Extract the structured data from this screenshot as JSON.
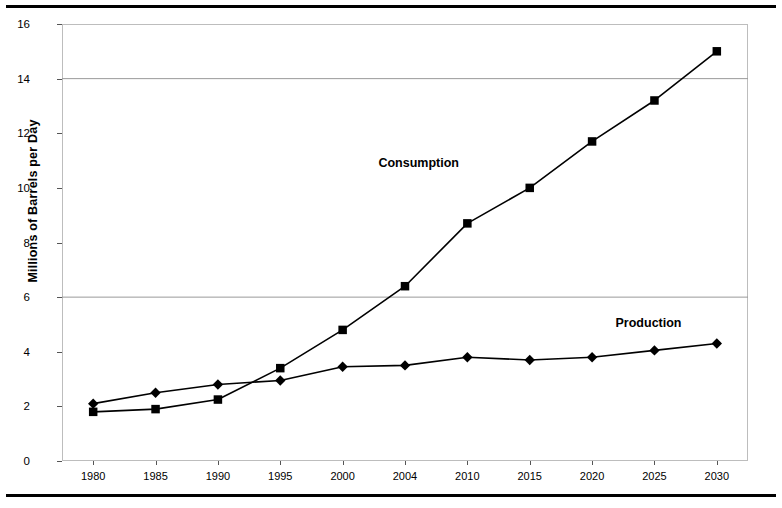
{
  "chart_data": {
    "type": "line",
    "title": "",
    "xlabel": "",
    "ylabel": "Millions of Barrels per Day",
    "categories": [
      "1980",
      "1985",
      "1990",
      "1995",
      "2000",
      "2004",
      "2010",
      "2015",
      "2020",
      "2025",
      "2030"
    ],
    "ylim": [
      0,
      16
    ],
    "ytick_values": [
      0,
      2,
      4,
      6,
      8,
      10,
      12,
      14,
      16
    ],
    "ytick_labels": [
      "0",
      "2",
      "4",
      "6",
      "8",
      "10",
      "12",
      "14",
      "16"
    ],
    "grid": "horizontal gridlines at 6 and 14",
    "gridlines": [
      6,
      14
    ],
    "legend_position": "inline annotations on plot",
    "series": [
      {
        "name": "Consumption",
        "marker": "square",
        "color": "#000000",
        "label_x_category": "2004",
        "values": [
          1.8,
          1.9,
          2.25,
          3.4,
          4.8,
          6.4,
          8.7,
          10.0,
          11.7,
          13.2,
          15.0
        ]
      },
      {
        "name": "Production",
        "marker": "diamond",
        "color": "#000000",
        "label_x_category": "2025",
        "values": [
          2.1,
          2.5,
          2.8,
          2.95,
          3.45,
          3.5,
          3.8,
          3.7,
          3.8,
          4.05,
          4.3
        ]
      }
    ],
    "annotations": [
      {
        "text": "Consumption",
        "x": 0.52,
        "y": 10.9
      },
      {
        "text": "Production",
        "x": 0.855,
        "y": 5.05
      }
    ]
  },
  "colors": {
    "line": "#000000",
    "frame": "#bdbdbd",
    "grid": "#9a9a9a",
    "rule": "#000000",
    "background": "#ffffff"
  }
}
